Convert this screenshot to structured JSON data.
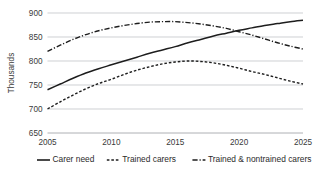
{
  "chart_data": {
    "type": "line",
    "title": "",
    "subtitle": "",
    "xlabel": "",
    "ylabel": "Thousands",
    "xlim": [
      2005,
      2025
    ],
    "ylim": [
      650,
      900
    ],
    "yticks": [
      650,
      700,
      750,
      800,
      850,
      900
    ],
    "ytick_labels": [
      "650",
      "700",
      "750",
      "800",
      "850",
      "900"
    ],
    "xticks": [
      2005,
      2010,
      2015,
      2020,
      2025
    ],
    "xtick_labels": [
      "2005",
      "2010",
      "2015",
      "2020",
      "2025"
    ],
    "grid": "horizontal",
    "legend_position": "bottom",
    "x": [
      2005,
      2006,
      2007,
      2008,
      2009,
      2010,
      2011,
      2012,
      2013,
      2014,
      2015,
      2016,
      2017,
      2018,
      2019,
      2020,
      2021,
      2022,
      2023,
      2024,
      2025
    ],
    "series": [
      {
        "name": "Carer need",
        "style": "solid",
        "color": "#1d1d1d",
        "values": [
          740,
          752,
          764,
          775,
          784,
          792,
          800,
          808,
          816,
          823,
          830,
          838,
          845,
          852,
          858,
          864,
          869,
          874,
          878,
          882,
          885
        ]
      },
      {
        "name": "Trained carers",
        "style": "dotted",
        "color": "#1d1d1d",
        "values": [
          700,
          715,
          729,
          742,
          753,
          762,
          772,
          781,
          788,
          794,
          798,
          800,
          799,
          796,
          791,
          785,
          778,
          772,
          765,
          758,
          752
        ]
      },
      {
        "name": "Trained & nontrained carers",
        "style": "dash-dot",
        "color": "#1d1d1d",
        "values": [
          820,
          833,
          845,
          855,
          863,
          869,
          874,
          878,
          881,
          882,
          882,
          880,
          877,
          873,
          868,
          861,
          854,
          846,
          838,
          831,
          825
        ]
      }
    ],
    "annotations": []
  },
  "legend": {
    "items": [
      {
        "label": "Carer need",
        "key": "solid-line-key"
      },
      {
        "label": "Trained carers",
        "key": "dotted-line-key"
      },
      {
        "label": "Trained & nontrained carers",
        "key": "dash-dot-line-key"
      }
    ]
  },
  "colors": {
    "series": "#1d1d1d",
    "gridline": "#b9bcc0",
    "axis": "#9a9da1",
    "text": "#2b2b2b",
    "background": "#ffffff"
  }
}
